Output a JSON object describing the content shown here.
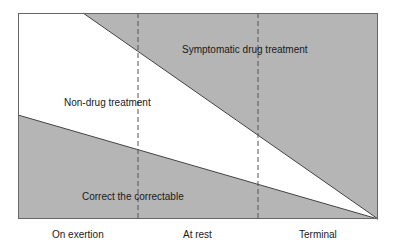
{
  "diagram": {
    "regions": [
      {
        "name": "Symptomatic drug treatment",
        "fill": "#b5b5b5"
      },
      {
        "name": "Non-drug treatment",
        "fill": "#ffffff"
      },
      {
        "name": "Correct the correctable",
        "fill": "#b5b5b5"
      }
    ],
    "labels": {
      "symptomatic": "Symptomatic drug treatment",
      "non_drug": "Non-drug treatment",
      "correctable": "Correct the correctable"
    },
    "x_axis": {
      "categories": [
        "On exertion",
        "At rest",
        "Terminal"
      ]
    },
    "colors": {
      "shaded": "#b5b5b5",
      "line": "#444444",
      "dashed": "#555555"
    }
  }
}
